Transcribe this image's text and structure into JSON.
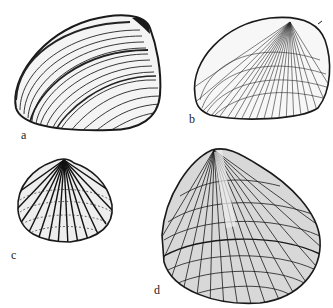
{
  "figure": {
    "top_caption": "",
    "ink_color": "#1a1a1a",
    "background": "#ffffff",
    "panels": [
      {
        "id": "a",
        "label": "a",
        "description": "smooth clam shell with concentric growth lines"
      },
      {
        "id": "b",
        "label": "b",
        "description": "rounded shell with fine radial and concentric ribs"
      },
      {
        "id": "c",
        "label": "c",
        "description": "small cockle-like shell with strong radial ribs"
      },
      {
        "id": "d",
        "label": "d",
        "description": "large triangular shell with reticulate sculpture"
      }
    ]
  }
}
